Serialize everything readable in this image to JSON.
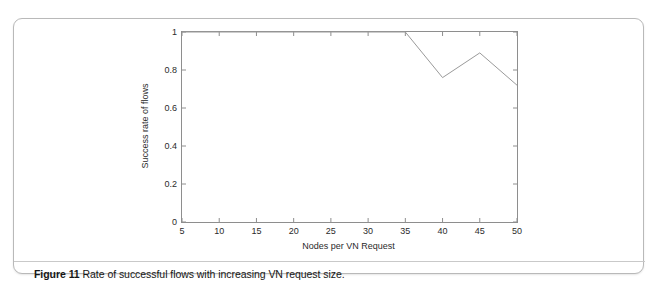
{
  "figure": {
    "caption_label": "Figure 11",
    "caption_text": "Rate of successful flows with increasing VN request size."
  },
  "chart_data": {
    "type": "line",
    "title": "",
    "xlabel": "Nodes per VN Request",
    "ylabel": "Success rate of flows",
    "xlim": [
      5,
      50
    ],
    "ylim": [
      0,
      1
    ],
    "xticks": [
      5,
      10,
      15,
      20,
      25,
      30,
      35,
      40,
      45,
      50
    ],
    "xtick_labels": [
      "5",
      "10",
      "15",
      "20",
      "25",
      "30",
      "35",
      "40",
      "45",
      "50"
    ],
    "yticks": [
      0,
      0.2,
      0.4,
      0.6,
      0.8,
      1
    ],
    "ytick_labels": [
      "0",
      "0.2",
      "0.4",
      "0.6",
      "0.8",
      "1"
    ],
    "grid": false,
    "legend": null,
    "line_color": "#9a9a9a",
    "axis_color": "#8e8e8e",
    "series": [
      {
        "name": "Success rate of flows",
        "x": [
          5,
          10,
          15,
          20,
          25,
          30,
          35,
          40,
          45,
          50
        ],
        "values": [
          1,
          1,
          1,
          1,
          1,
          1,
          1,
          0.76,
          0.89,
          0.72
        ]
      }
    ]
  }
}
